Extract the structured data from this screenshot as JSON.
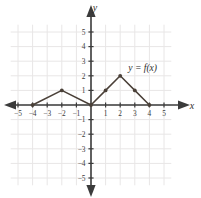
{
  "chart_data": {
    "type": "line",
    "title": "",
    "xlabel": "x",
    "ylabel": "y",
    "xlim": [
      -5.8,
      5.8
    ],
    "ylim": [
      -5.8,
      5.8
    ],
    "grid": true,
    "legend": "none",
    "annotations": [
      {
        "text": "y = f(x)",
        "x": 2.55,
        "y": 2.35
      }
    ],
    "xticks": [
      -5,
      -4,
      -3,
      -2,
      -1,
      1,
      2,
      3,
      4,
      5
    ],
    "yticks": [
      5,
      4,
      3,
      2,
      1,
      -1,
      -2,
      -3,
      -4,
      -5
    ],
    "xtick_labels": [
      "−5",
      "−4",
      "−3",
      "−2",
      "−1",
      "1",
      "2",
      "3",
      "4",
      "5"
    ],
    "ytick_labels": [
      "5",
      "4",
      "3",
      "2",
      "1",
      "−1",
      "−2",
      "−3",
      "−4",
      "−5"
    ],
    "series": [
      {
        "name": "f(x)",
        "marker": "point",
        "color": "#4a4038",
        "points": [
          {
            "x": -4,
            "y": 0
          },
          {
            "x": -2,
            "y": 1
          },
          {
            "x": 0,
            "y": 0
          },
          {
            "x": 1,
            "y": 1
          },
          {
            "x": 2,
            "y": 2
          },
          {
            "x": 3,
            "y": 1
          },
          {
            "x": 4,
            "y": 0
          }
        ]
      }
    ]
  },
  "colors": {
    "curve": "#4a4038",
    "axis": "#3b3b3b",
    "grid": "#e8e6e6",
    "text": "#2e2e2e",
    "background": "#ffffff"
  },
  "labels": {
    "x_axis": "x",
    "y_axis": "y",
    "function_label": "y = f(x)"
  }
}
